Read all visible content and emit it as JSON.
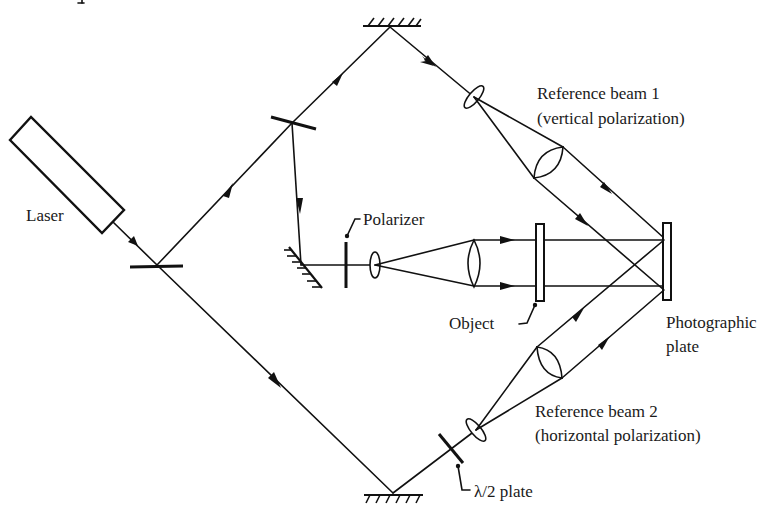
{
  "diagram": {
    "type": "optical holography setup (dual-polarization reference beams)",
    "colors": {
      "ink": "#111111",
      "background": "#ffffff"
    },
    "labels": {
      "laser": "Laser",
      "polarizer": "Polarizer",
      "object": "Object",
      "plate_line1": "Photographic",
      "plate_line2": "plate",
      "ref1_line1": "Reference beam 1",
      "ref1_line2": "(vertical polarization)",
      "ref2_line1": "Reference beam 2",
      "ref2_line2": "(horizontal polarization)",
      "halfwave": "λ/2 plate"
    },
    "components": [
      {
        "name": "laser",
        "icon": "rectangle"
      },
      {
        "name": "beam-splitter-1",
        "icon": "line"
      },
      {
        "name": "beam-splitter-2",
        "icon": "line"
      },
      {
        "name": "top-mirror",
        "icon": "hatched-mirror"
      },
      {
        "name": "bottom-mirror",
        "icon": "hatched-mirror"
      },
      {
        "name": "object-mirror",
        "icon": "hatched-mirror"
      },
      {
        "name": "polarizer",
        "icon": "line"
      },
      {
        "name": "half-wave-plate",
        "icon": "line"
      },
      {
        "name": "lenses",
        "count": 6,
        "icon": "ellipse"
      },
      {
        "name": "object",
        "icon": "rectangle"
      },
      {
        "name": "photographic-plate",
        "icon": "rectangle"
      }
    ]
  }
}
